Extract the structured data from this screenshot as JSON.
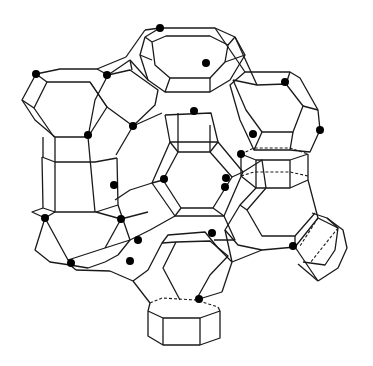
{
  "figure": {
    "colors": {
      "line": "#1a1a1a",
      "dot": "#000000",
      "background": "#ffffff"
    },
    "dot_count": 23
  }
}
